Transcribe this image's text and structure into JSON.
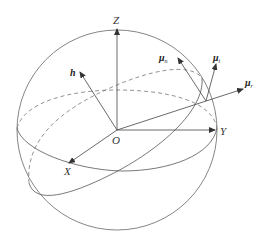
{
  "diagram": {
    "type": "unit sphere with coordinate axes and vectors",
    "axes": {
      "origin": "O",
      "x": "X",
      "y": "Y",
      "z": "Z"
    },
    "vectors": [
      {
        "name": "h",
        "label": "h"
      },
      {
        "name": "mu_n",
        "label": "μ",
        "subscript": "n"
      },
      {
        "name": "mu_t",
        "label": "μ",
        "subscript": "t"
      },
      {
        "name": "mu_r",
        "label": "μ",
        "subscript": "r"
      }
    ],
    "colors": {
      "stroke": "#555555",
      "text": "#333333",
      "background": "#ffffff"
    }
  }
}
